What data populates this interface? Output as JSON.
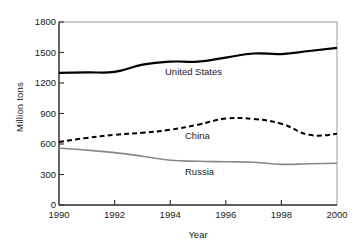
{
  "chart_data": {
    "type": "line",
    "title": "",
    "xlabel": "Year",
    "ylabel": "Million tons",
    "xlim": [
      1990,
      2000
    ],
    "ylim": [
      0,
      1800
    ],
    "xticks": [
      "1990",
      "1992",
      "1994",
      "1996",
      "1998",
      "2000"
    ],
    "yticks": [
      "0",
      "300",
      "600",
      "900",
      "1200",
      "1500",
      "1800"
    ],
    "grid": false,
    "legend_position": "inline-annotations",
    "x": [
      1990,
      1991,
      1992,
      1993,
      1994,
      1995,
      1996,
      1997,
      1998,
      1999,
      2000
    ],
    "series": [
      {
        "name": "United States",
        "style": "solid",
        "color": "#000000",
        "width": 2.2,
        "values": [
          1300,
          1305,
          1310,
          1380,
          1410,
          1410,
          1450,
          1490,
          1485,
          1515,
          1545
        ]
      },
      {
        "name": "China",
        "style": "dashed",
        "color": "#000000",
        "width": 2.0,
        "values": [
          620,
          660,
          690,
          710,
          740,
          790,
          850,
          845,
          800,
          690,
          700
        ]
      },
      {
        "name": "Russia",
        "style": "solid",
        "color": "#888888",
        "width": 1.6,
        "values": [
          560,
          540,
          515,
          480,
          440,
          430,
          425,
          420,
          400,
          405,
          410
        ]
      }
    ],
    "annotations": [
      {
        "text": "United States",
        "x": 1994.1,
        "y": 1240
      },
      {
        "text": "China",
        "x": 1994.8,
        "y": 655
      },
      {
        "text": "Russia",
        "x": 1994.8,
        "y": 300
      }
    ]
  },
  "axes": {
    "x_title": "Year",
    "y_title": "Million tons",
    "x_tick_labels": [
      "1990",
      "1992",
      "1994",
      "1996",
      "1998",
      "2000"
    ],
    "y_tick_labels": [
      "1800",
      "1500",
      "1200",
      "900",
      "600",
      "300",
      "0"
    ]
  },
  "colors": {
    "background": "#ffffff",
    "axis": "#3a3a3a",
    "text": "#1a1a1a",
    "series_us": "#000000",
    "series_china": "#000000",
    "series_russia": "#888888"
  }
}
